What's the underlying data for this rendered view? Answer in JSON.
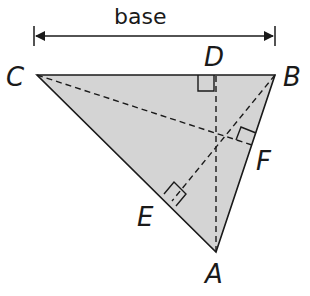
{
  "diagram": {
    "base_label": "base",
    "vertices": {
      "A": {
        "label": "A",
        "x": 216,
        "y": 252
      },
      "B": {
        "label": "B",
        "x": 275,
        "y": 75
      },
      "C": {
        "label": "C",
        "x": 37,
        "y": 75
      }
    },
    "feet": {
      "D": {
        "label": "D",
        "x": 216,
        "y": 75
      },
      "E": {
        "label": "E",
        "x": 172,
        "y": 201
      },
      "F": {
        "label": "F",
        "x": 252,
        "y": 145
      }
    },
    "colors": {
      "fill": "#d4d4d4",
      "stroke": "#1a1a1a"
    }
  }
}
